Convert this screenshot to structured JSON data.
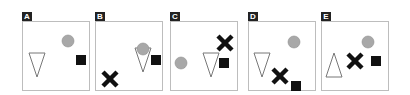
{
  "figure": {
    "colors": {
      "circle": "#a8a8a8",
      "circle_stroke": "#8f8f8f",
      "square": "#111111",
      "cross": "#111111",
      "triangle_stroke": "#777777",
      "border": "#bdbdbd",
      "label_bg": "#222222",
      "label_fg": "#ffffff"
    },
    "panels": [
      {
        "label": "A",
        "x": 22,
        "y": 12,
        "shapes": [
          {
            "type": "circle",
            "cx": 45,
            "cy": 19,
            "r": 6
          },
          {
            "type": "square",
            "x": 53,
            "y": 33,
            "s": 10
          },
          {
            "type": "triangle-down",
            "cx": 14,
            "cy": 43,
            "w": 16,
            "h": 24
          }
        ]
      },
      {
        "label": "B",
        "x": 95,
        "y": 12,
        "shapes": [
          {
            "type": "triangle-down",
            "cx": 47,
            "cy": 38,
            "w": 16,
            "h": 24
          },
          {
            "type": "circle",
            "cx": 47,
            "cy": 27,
            "r": 6
          },
          {
            "type": "square",
            "x": 55,
            "y": 33,
            "s": 10
          },
          {
            "type": "cross",
            "cx": 14,
            "cy": 57,
            "s": 14
          }
        ]
      },
      {
        "label": "C",
        "x": 170,
        "y": 12,
        "shapes": [
          {
            "type": "circle",
            "cx": 10,
            "cy": 41,
            "r": 6
          },
          {
            "type": "triangle-down",
            "cx": 40,
            "cy": 43,
            "w": 16,
            "h": 24
          },
          {
            "type": "square",
            "x": 48,
            "y": 36,
            "s": 10
          },
          {
            "type": "cross",
            "cx": 54,
            "cy": 21,
            "s": 14
          }
        ]
      },
      {
        "label": "D",
        "x": 248,
        "y": 12,
        "shapes": [
          {
            "type": "circle",
            "cx": 45,
            "cy": 20,
            "r": 6
          },
          {
            "type": "triangle-down",
            "cx": 13,
            "cy": 43,
            "w": 16,
            "h": 24
          },
          {
            "type": "cross",
            "cx": 31,
            "cy": 54,
            "s": 14
          },
          {
            "type": "square",
            "x": 42,
            "y": 59,
            "s": 10
          }
        ]
      },
      {
        "label": "E",
        "x": 321,
        "y": 12,
        "shapes": [
          {
            "type": "circle",
            "cx": 46,
            "cy": 20,
            "r": 6
          },
          {
            "type": "triangle-up",
            "cx": 12,
            "cy": 43,
            "w": 16,
            "h": 24
          },
          {
            "type": "cross",
            "cx": 33,
            "cy": 39,
            "s": 14
          },
          {
            "type": "square",
            "x": 49,
            "y": 34,
            "s": 10
          }
        ]
      }
    ],
    "panel_size": {
      "w": 66,
      "h": 68,
      "label_h": 9
    }
  }
}
